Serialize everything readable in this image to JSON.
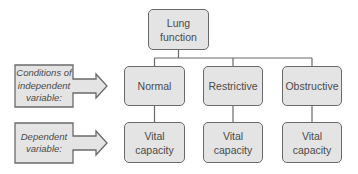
{
  "diagram": {
    "root": {
      "label": "Lung function"
    },
    "side_labels": [
      {
        "label": "Conditions of independent variable:"
      },
      {
        "label": "Dependent variable:"
      }
    ],
    "conditions": [
      {
        "label": "Normal"
      },
      {
        "label": "Restrictive"
      },
      {
        "label": "Obstructive"
      }
    ],
    "outcomes": [
      {
        "label": "Vital capacity"
      },
      {
        "label": "Vital capacity"
      },
      {
        "label": "Vital capacity"
      }
    ],
    "colors": {
      "box_fill": "#e4e4e4",
      "box_stroke": "#6a6a6a",
      "text": "#4a4a4a"
    }
  }
}
